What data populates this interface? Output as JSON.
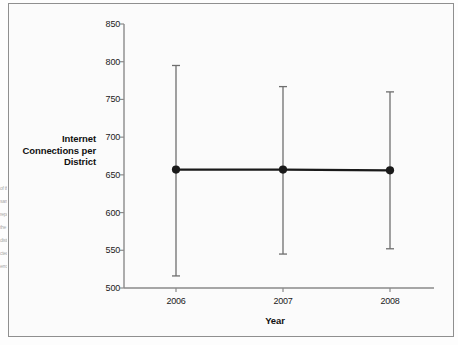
{
  "figure": {
    "margin_bleed_lines": [
      "of th",
      "sam",
      "repo",
      "the",
      "distr",
      "cted",
      "erro"
    ]
  },
  "chart_data": {
    "type": "line",
    "title": "",
    "subtitle": "",
    "xlabel": "Year",
    "ylabel": "Internet Connections per District",
    "categories": [
      "2006",
      "2007",
      "2008"
    ],
    "x": [
      2006,
      2007,
      2008
    ],
    "series": [
      {
        "name": "Internet Connections per District",
        "values": [
          657,
          657,
          656
        ],
        "error_low": [
          516,
          545,
          552
        ],
        "error_high": [
          795,
          767,
          760
        ]
      }
    ],
    "xtick_labels": [
      "2006",
      "2007",
      "2008"
    ],
    "ytick_labels": [
      "500",
      "550",
      "600",
      "650",
      "700",
      "750",
      "800",
      "850"
    ],
    "yticks": [
      500,
      550,
      600,
      650,
      700,
      750,
      800,
      850
    ],
    "ylim": [
      500,
      850
    ],
    "grid": false,
    "legend": "none",
    "marker": "filled-circle",
    "error_bar_style": "capped-vertical",
    "line_color": "#1a1a1a",
    "marker_color": "#1a1a1a",
    "error_bar_color": "#6e6e6e",
    "axis_color": "#8a8a8a",
    "background_color": "#fbfbfb"
  }
}
